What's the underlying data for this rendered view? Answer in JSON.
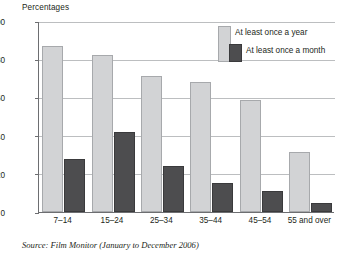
{
  "axis_title": "Percentages",
  "source_note": "Source: Film Monitor (January to December 2006)",
  "legend": {
    "position": "top-right",
    "entries": [
      {
        "label": "At least once a year",
        "color": "#d2d3d5"
      },
      {
        "label": "At least once a month",
        "color": "#4d4d4f"
      }
    ]
  },
  "chart_data": {
    "type": "bar",
    "title": "",
    "subtitle": "",
    "xlabel": "",
    "ylabel": "Percentages",
    "ylim": [
      0,
      100
    ],
    "yticks": [
      0,
      20,
      40,
      60,
      80,
      100
    ],
    "ytick_labels": [
      "0",
      "20",
      "40",
      "60",
      "80",
      "100"
    ],
    "grid": true,
    "grid_axis": "y",
    "legend_position": "top-right",
    "categories": [
      "7–14",
      "15–24",
      "25–34",
      "35–44",
      "45–54",
      "55 and over"
    ],
    "series": [
      {
        "name": "At least once a year",
        "color": "#d2d3d5",
        "values": [
          87,
          82,
          71,
          68,
          58.5,
          31.5
        ]
      },
      {
        "name": "At least once a month",
        "color": "#4d4d4f",
        "values": [
          28,
          42,
          24,
          15,
          11,
          4.5
        ]
      }
    ]
  },
  "colors": {
    "series_year": "#d2d3d5",
    "series_year_border": "#a7a9ac",
    "series_month": "#4d4d4f",
    "series_month_border": "#3a3a3c",
    "gridline": "#bcbec0",
    "axis": "#6d6e71",
    "text": "#231f20",
    "background": "#ffffff"
  }
}
